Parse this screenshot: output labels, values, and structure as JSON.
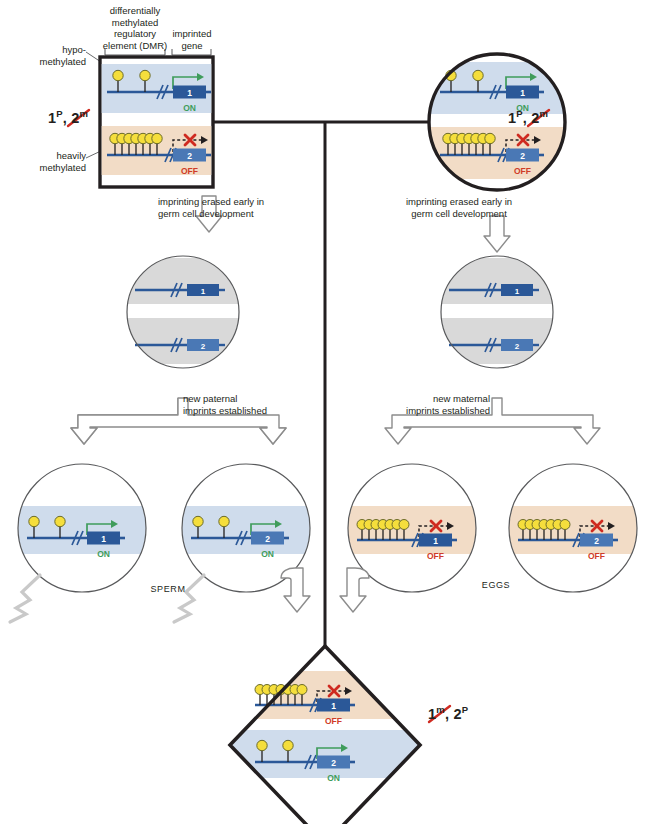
{
  "figure": {
    "annotations": {
      "dmr_label": "differentially\nmethylated\nregulatory\nelement (DMR)",
      "dmr_label_lines": [
        "differentially",
        "methylated",
        "regulatory",
        "element (DMR)"
      ],
      "imprinted_gene_label_lines": [
        "imprinted",
        "gene"
      ],
      "hypo_label_lines": [
        "hypo-",
        "methylated"
      ],
      "heavy_label_lines": [
        "heavily",
        "methylated"
      ],
      "erase_left_lines": [
        "imprinting erased early in",
        "germ cell development"
      ],
      "erase_right_lines": [
        "imprinting erased early in",
        "germ cell development"
      ],
      "paternal_lines": [
        "new paternal",
        "imprints established"
      ],
      "maternal_lines": [
        "new maternal",
        "imprints established"
      ],
      "sperm_label": "SPERM",
      "eggs_label": "EGGS"
    },
    "genotypes": {
      "parent_left": {
        "first": "1",
        "first_sup": "P",
        "sep": ", ",
        "second": "2",
        "second_sup": "m",
        "struck": "second"
      },
      "parent_right": {
        "first": "1",
        "first_sup": "P",
        "sep": ", ",
        "second": "2",
        "second_sup": "m",
        "struck": "second"
      },
      "zygote": {
        "first": "1",
        "first_sup": "m",
        "sep": ", ",
        "second": "2",
        "second_sup": "P",
        "struck": "first"
      }
    },
    "cells": {
      "parent_left": {
        "shape": "square",
        "alleles": [
          {
            "gene": "1",
            "state": "ON",
            "band": "blue",
            "methylation": "hypo",
            "dots": 2
          },
          {
            "gene": "2",
            "state": "OFF",
            "band": "tan",
            "methylation": "heavy",
            "dots": 7
          }
        ]
      },
      "parent_right": {
        "shape": "circle",
        "alleles": [
          {
            "gene": "1",
            "state": "ON",
            "band": "blue",
            "methylation": "hypo",
            "dots": 2
          },
          {
            "gene": "2",
            "state": "OFF",
            "band": "tan",
            "methylation": "heavy",
            "dots": 7
          }
        ]
      },
      "erased_left": {
        "shape": "circle",
        "alleles": [
          {
            "gene": "1",
            "state": "",
            "band": "grey",
            "methylation": "none",
            "dots": 0
          },
          {
            "gene": "2",
            "state": "",
            "band": "grey",
            "methylation": "none",
            "dots": 0
          }
        ]
      },
      "erased_right": {
        "shape": "circle",
        "alleles": [
          {
            "gene": "1",
            "state": "",
            "band": "grey",
            "methylation": "none",
            "dots": 0
          },
          {
            "gene": "2",
            "state": "",
            "band": "grey",
            "methylation": "none",
            "dots": 0
          }
        ]
      },
      "sperm_1": {
        "shape": "circle",
        "alleles": [
          {
            "gene": "1",
            "state": "ON",
            "band": "blue",
            "methylation": "hypo",
            "dots": 2
          }
        ]
      },
      "sperm_2": {
        "shape": "circle",
        "alleles": [
          {
            "gene": "2",
            "state": "ON",
            "band": "blue",
            "methylation": "hypo",
            "dots": 2
          }
        ]
      },
      "egg_1": {
        "shape": "circle",
        "alleles": [
          {
            "gene": "1",
            "state": "OFF",
            "band": "tan",
            "methylation": "heavy",
            "dots": 7
          }
        ]
      },
      "egg_2": {
        "shape": "circle",
        "alleles": [
          {
            "gene": "2",
            "state": "OFF",
            "band": "tan",
            "methylation": "heavy",
            "dots": 7
          }
        ]
      },
      "zygote": {
        "shape": "diamond",
        "alleles": [
          {
            "gene": "1",
            "state": "OFF",
            "band": "tan",
            "methylation": "heavy",
            "dots": 7
          },
          {
            "gene": "2",
            "state": "ON",
            "band": "blue",
            "methylation": "hypo",
            "dots": 2
          }
        ]
      }
    },
    "state_labels": {
      "on": "ON",
      "off": "OFF"
    },
    "colors": {
      "gene_box": "#2b5898",
      "gene_box_light": "#4a78b5",
      "dna_line": "#2b5898",
      "methyl_dot": "#f5de3c",
      "methyl_dot_stroke": "#6b6b2a",
      "band_blue": "#cfdcec",
      "band_tan": "#f2dcc6",
      "band_grey": "#d9d9d9",
      "on_green": "#3f9c5b",
      "off_red": "#cf3b28",
      "x_red": "#cf2a20",
      "outline": "#231f20",
      "arrow_grey": "#8c8c8c",
      "text": "#231f20"
    }
  }
}
